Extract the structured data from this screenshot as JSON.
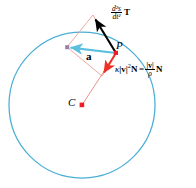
{
  "diagram": {
    "colors": {
      "circle": "#4aafd5",
      "resultant_vector": "#5bc0e0",
      "normal_vector": "#ee3124",
      "tangential_vector": "#000000",
      "parallelogram": "#e7a39a",
      "radius_line": "#e8857c",
      "point_marker": "#ee1c25",
      "background": "#ffffff"
    },
    "labels": {
      "point_p": "P",
      "center_c": "C",
      "resultant": "a",
      "tangential": {
        "fraction_numerator": "d²s",
        "fraction_denominator": "dt²",
        "vector": "T"
      },
      "normal": {
        "kappa": "κ",
        "speed_magnitude": "|v|",
        "exponent": "2",
        "vector": "N",
        "equals": "=",
        "rho_numerator": "|v|",
        "rho_denominator": "ρ",
        "rho_vector": "N"
      }
    },
    "geometry": {
      "circle_center": [
        82,
        105
      ],
      "circle_radius": 73,
      "point_p": [
        116,
        53
      ],
      "tangential_tip": [
        93,
        15
      ],
      "normal_tip": [
        102,
        76
      ],
      "resultant_tip": [
        67,
        47
      ]
    }
  }
}
